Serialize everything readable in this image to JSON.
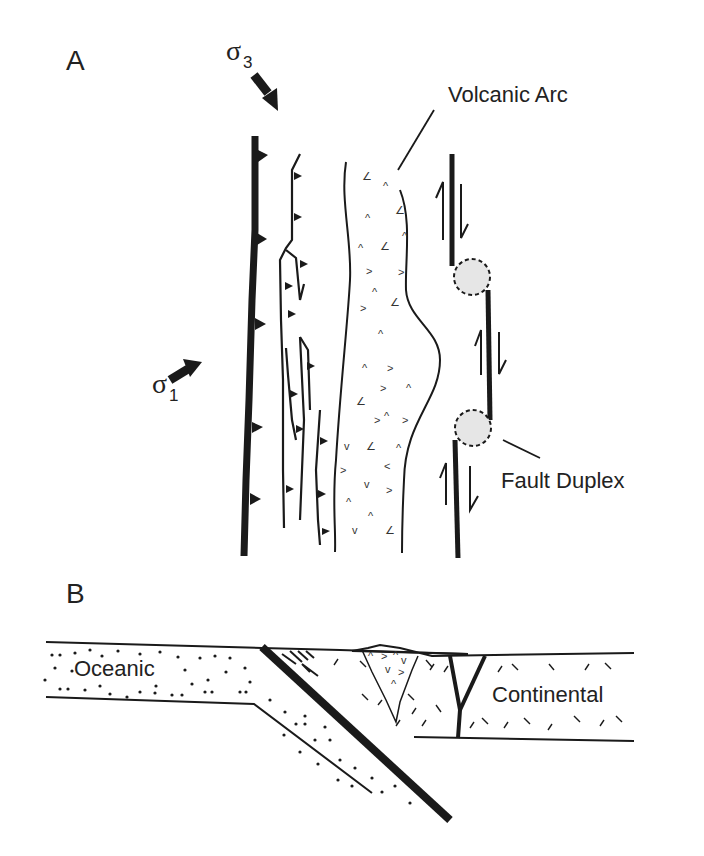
{
  "figure": {
    "panels": [
      {
        "id": "A",
        "label": "A"
      },
      {
        "id": "B",
        "label": "B"
      }
    ],
    "panel_a": {
      "stress_labels": {
        "sigma3": {
          "symbol": "σ",
          "subscript": "3"
        },
        "sigma1": {
          "symbol": "σ",
          "subscript": "1"
        }
      },
      "annotations": {
        "volcanic_arc": "Volcanic Arc",
        "fault_duplex": "Fault Duplex"
      }
    },
    "panel_b": {
      "annotations": {
        "oceanic": "Oceanic",
        "continental": "Continental"
      }
    },
    "colors": {
      "ink": "#1a1a1a",
      "duplex_fill": "#e6e6e6",
      "background": "#ffffff"
    }
  }
}
